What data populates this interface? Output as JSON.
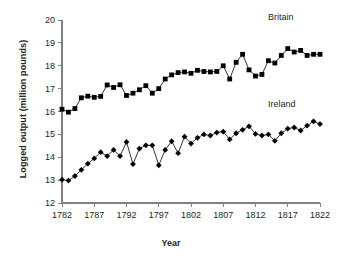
{
  "chart_data": {
    "type": "line",
    "title": "",
    "xlabel": "Year",
    "ylabel": "Logged output (million pounds)",
    "xlim": [
      1782,
      1822
    ],
    "ylim": [
      12,
      20
    ],
    "xticks": [
      1782,
      1787,
      1792,
      1797,
      1802,
      1807,
      1812,
      1817,
      1822
    ],
    "yticks": [
      12,
      13,
      14,
      15,
      16,
      17,
      18,
      19,
      20
    ],
    "grid": false,
    "legend_position": "inline-right",
    "x": [
      1782,
      1783,
      1784,
      1785,
      1786,
      1787,
      1788,
      1789,
      1790,
      1791,
      1792,
      1793,
      1794,
      1795,
      1796,
      1797,
      1798,
      1799,
      1800,
      1801,
      1802,
      1803,
      1804,
      1805,
      1806,
      1807,
      1808,
      1809,
      1810,
      1811,
      1812,
      1813,
      1814,
      1815,
      1816,
      1817,
      1818,
      1819,
      1820,
      1821,
      1822
    ],
    "series": [
      {
        "name": "Britain",
        "marker": "square",
        "color": "#000000",
        "values": [
          16.1,
          15.97,
          16.13,
          16.6,
          16.67,
          16.62,
          16.66,
          17.16,
          17.05,
          17.17,
          16.7,
          16.8,
          16.95,
          17.13,
          16.8,
          17.0,
          17.42,
          17.6,
          17.7,
          17.73,
          17.67,
          17.8,
          17.75,
          17.73,
          17.75,
          18.0,
          17.42,
          18.15,
          18.5,
          17.82,
          17.55,
          17.62,
          18.22,
          18.12,
          18.45,
          18.75,
          18.6,
          18.67,
          18.45,
          18.5,
          18.5
        ]
      },
      {
        "name": "Ireland",
        "marker": "diamond",
        "color": "#000000",
        "values": [
          13.02,
          12.98,
          13.18,
          13.45,
          13.72,
          13.95,
          14.22,
          14.05,
          14.32,
          14.05,
          14.67,
          13.7,
          14.38,
          14.52,
          14.52,
          13.65,
          14.32,
          14.7,
          14.18,
          14.9,
          14.6,
          14.85,
          15.0,
          14.95,
          15.08,
          15.12,
          14.78,
          15.05,
          15.2,
          15.35,
          15.02,
          14.95,
          15.0,
          14.72,
          15.05,
          15.25,
          15.3,
          15.17,
          15.38,
          15.57,
          15.45
        ]
      }
    ]
  }
}
